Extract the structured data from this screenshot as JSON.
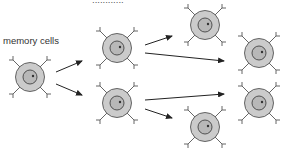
{
  "diagram": {
    "labels": {
      "memory_cells": "memory cells",
      "top_cut_text": "............"
    },
    "colors": {
      "cell_outer": "#c8c8c8",
      "cell_outline": "#555555",
      "nucleus": "#bdbdbd",
      "nucleus_outline": "#444444",
      "arrow": "#222222",
      "receptor": "#555555",
      "label_text": "#333333"
    },
    "cells": [
      {
        "id": "memory-cell",
        "cx": 30,
        "cy": 77
      },
      {
        "id": "gen1-top",
        "cx": 117,
        "cy": 48
      },
      {
        "id": "gen1-bottom",
        "cx": 117,
        "cy": 103
      },
      {
        "id": "gen2-a",
        "cx": 205,
        "cy": 25
      },
      {
        "id": "gen2-b",
        "cx": 259,
        "cy": 53
      },
      {
        "id": "gen2-c",
        "cx": 259,
        "cy": 103
      },
      {
        "id": "gen2-d",
        "cx": 205,
        "cy": 127
      }
    ],
    "arrows": [
      {
        "from": "memory-cell",
        "to": "gen1-top",
        "x1": 56,
        "y1": 72,
        "x2": 82,
        "y2": 61
      },
      {
        "from": "memory-cell",
        "to": "gen1-bottom",
        "x1": 56,
        "y1": 84,
        "x2": 82,
        "y2": 95
      },
      {
        "from": "gen1-top",
        "to": "gen2-a",
        "x1": 145,
        "y1": 45,
        "x2": 172,
        "y2": 36
      },
      {
        "from": "gen1-top",
        "to": "gen2-b",
        "x1": 145,
        "y1": 53,
        "x2": 224,
        "y2": 61
      },
      {
        "from": "gen1-bottom",
        "to": "gen2-c",
        "x1": 145,
        "y1": 100,
        "x2": 224,
        "y2": 94
      },
      {
        "from": "gen1-bottom",
        "to": "gen2-d",
        "x1": 145,
        "y1": 109,
        "x2": 172,
        "y2": 118
      }
    ]
  }
}
